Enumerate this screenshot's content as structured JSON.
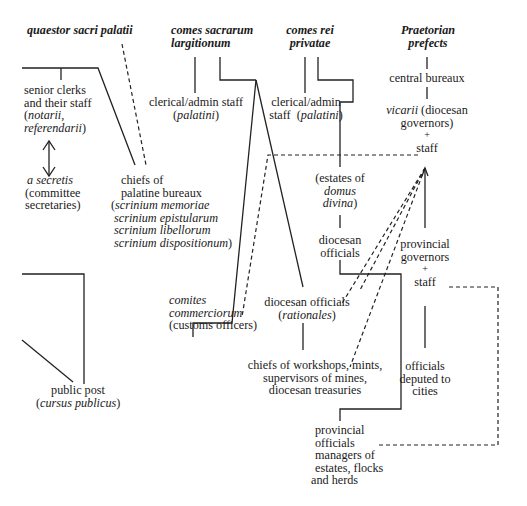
{
  "diagram": {
    "headers": {
      "quaestor": "quaestor sacri palatii",
      "largitionum_line1": "comes sacrarum",
      "largitionum_line2": "largitionum",
      "privatae_line1": "comes rei",
      "privatae_line2": "privatae",
      "prefects_line1": "Praetorian",
      "prefects_line2": "prefects"
    },
    "quaestor_branch": {
      "senior_clerks": {
        "line1": "senior clerks",
        "line2": "and their staff",
        "line3_open": "(",
        "line3_italic": "notarii,",
        "line4_italic": "referendarii",
        "line4_close": ")"
      },
      "a_secretis": {
        "line1_italic": "a secretis",
        "line2": "(committee",
        "line3": "secretaries)"
      },
      "chiefs_palatine": {
        "line1": "chiefs of",
        "line2": "palatine bureaux",
        "line3_open": "(",
        "line3_italic": "scrinium memoriae",
        "line4_italic": "scrinium epistularum",
        "line5_italic": "scrinium libellorum",
        "line6_italic": "scrinium dispositionum",
        "line6_close": ")"
      },
      "public_post": {
        "line1": "public post",
        "line2_open": "(",
        "line2_italic": "cursus publicus",
        "line2_close": ")"
      }
    },
    "largitionum_branch": {
      "clerical_staff": {
        "line1": "clerical/admin staff",
        "line2_open": "(",
        "line2_italic": "palatini",
        "line2_close": ")"
      },
      "comites_commerciorum": {
        "line1_italic": "comites",
        "line2_italic": "commerciorum",
        "line3": "(customs officers)"
      },
      "diocesan_rationales": {
        "line1": "diocesan officials",
        "line2_open": "(",
        "line2_italic": "rationales",
        "line2_close": ")"
      },
      "chiefs_workshops": {
        "line1": "chiefs of workshops, mints,",
        "line2": "supervisors of mines,",
        "line3": "diocesan treasuries"
      }
    },
    "privatae_branch": {
      "clerical_staff": {
        "line1": "clerical/admin",
        "line2_pre": "staff  (",
        "line2_italic": "palatini",
        "line2_close": ")"
      },
      "estates": {
        "line1": "(estates of",
        "line2_italic": "domus",
        "line3_italic": "divina",
        "line3_close": ")"
      },
      "diocesan_officials": {
        "line1": "diocesan",
        "line2": "officials"
      },
      "provincial_officials": {
        "line1": "provincial",
        "line2": "officials",
        "line3": "managers of",
        "line4": "estates, flocks",
        "line5": "and herds"
      }
    },
    "prefects_branch": {
      "central_bureaux": "central bureaux",
      "vicarii": {
        "line1_italic": "vicarii",
        "line1_rest": " (diocesan",
        "line2": "governors)",
        "line3": "+",
        "line4": "staff"
      },
      "provincial_governors": {
        "line1": "provincial",
        "line2": "governors",
        "line3": "+",
        "line4": "staff"
      },
      "officials_cities": {
        "line1": "officials",
        "line2": "deputed to",
        "line3": "cities"
      }
    },
    "colors": {
      "line": "#222222",
      "text": "#1a1a1a",
      "background": "#ffffff"
    }
  }
}
